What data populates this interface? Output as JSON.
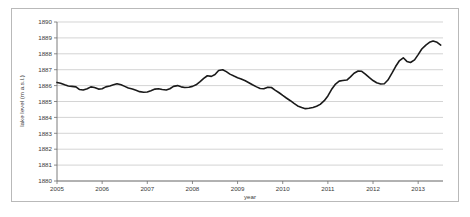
{
  "chart_data": {
    "type": "line",
    "title": "",
    "xlabel": "year",
    "ylabel": "lake level (m a.s.l.)",
    "xlim": [
      2005,
      2013.55
    ],
    "ylim": [
      1880,
      1890
    ],
    "grid": true,
    "legend": false,
    "xticks": [
      "2005",
      "2006",
      "2007",
      "2008",
      "2009",
      "2010",
      "2011",
      "2012",
      "2013"
    ],
    "xtick_values": [
      2005,
      2006,
      2007,
      2008,
      2009,
      2010,
      2011,
      2012,
      2013
    ],
    "yticks": [
      "1880",
      "1881",
      "1882",
      "1883",
      "1884",
      "1885",
      "1886",
      "1887",
      "1888",
      "1889",
      "1890"
    ],
    "ytick_values": [
      1880,
      1881,
      1882,
      1883,
      1884,
      1885,
      1886,
      1887,
      1888,
      1889,
      1890
    ],
    "series": [
      {
        "name": "lake level",
        "color": "#1a1a1a",
        "x": [
          2005.0,
          2005.08,
          2005.17,
          2005.25,
          2005.33,
          2005.42,
          2005.5,
          2005.58,
          2005.67,
          2005.75,
          2005.83,
          2005.92,
          2006.0,
          2006.08,
          2006.17,
          2006.25,
          2006.33,
          2006.42,
          2006.5,
          2006.58,
          2006.67,
          2006.75,
          2006.83,
          2006.92,
          2007.0,
          2007.08,
          2007.17,
          2007.25,
          2007.33,
          2007.42,
          2007.5,
          2007.58,
          2007.67,
          2007.75,
          2007.83,
          2007.92,
          2008.0,
          2008.08,
          2008.17,
          2008.25,
          2008.33,
          2008.42,
          2008.5,
          2008.58,
          2008.67,
          2008.75,
          2008.83,
          2008.92,
          2009.0,
          2009.08,
          2009.17,
          2009.25,
          2009.33,
          2009.42,
          2009.5,
          2009.58,
          2009.67,
          2009.75,
          2009.83,
          2009.92,
          2010.0,
          2010.08,
          2010.17,
          2010.25,
          2010.33,
          2010.42,
          2010.5,
          2010.58,
          2010.67,
          2010.75,
          2010.83,
          2010.92,
          2011.0,
          2011.08,
          2011.17,
          2011.25,
          2011.33,
          2011.42,
          2011.5,
          2011.58,
          2011.67,
          2011.75,
          2011.83,
          2011.92,
          2012.0,
          2012.08,
          2012.17,
          2012.25,
          2012.33,
          2012.42,
          2012.5,
          2012.58,
          2012.67,
          2012.75,
          2012.83,
          2012.92,
          2013.0,
          2013.08,
          2013.17,
          2013.25,
          2013.33,
          2013.42,
          2013.5
        ],
        "y": [
          1886.2,
          1886.15,
          1886.05,
          1885.98,
          1885.95,
          1885.92,
          1885.75,
          1885.72,
          1885.8,
          1885.92,
          1885.88,
          1885.78,
          1885.8,
          1885.92,
          1885.98,
          1886.05,
          1886.12,
          1886.05,
          1885.95,
          1885.85,
          1885.78,
          1885.7,
          1885.62,
          1885.58,
          1885.6,
          1885.68,
          1885.78,
          1885.8,
          1885.75,
          1885.72,
          1885.8,
          1885.95,
          1886.0,
          1885.92,
          1885.88,
          1885.9,
          1885.95,
          1886.05,
          1886.25,
          1886.45,
          1886.62,
          1886.58,
          1886.7,
          1886.95,
          1887.0,
          1886.88,
          1886.72,
          1886.6,
          1886.5,
          1886.42,
          1886.3,
          1886.18,
          1886.05,
          1885.92,
          1885.82,
          1885.8,
          1885.9,
          1885.88,
          1885.72,
          1885.55,
          1885.38,
          1885.22,
          1885.05,
          1884.88,
          1884.72,
          1884.62,
          1884.55,
          1884.58,
          1884.62,
          1884.7,
          1884.82,
          1885.05,
          1885.35,
          1885.75,
          1886.1,
          1886.28,
          1886.32,
          1886.35,
          1886.55,
          1886.78,
          1886.92,
          1886.9,
          1886.72,
          1886.5,
          1886.32,
          1886.18,
          1886.1,
          1886.12,
          1886.35,
          1886.78,
          1887.2,
          1887.55,
          1887.75,
          1887.52,
          1887.45,
          1887.62,
          1887.95,
          1888.3,
          1888.55,
          1888.72,
          1888.8,
          1888.72,
          1888.55
        ]
      }
    ]
  },
  "axes": {
    "y_title": "lake level (m a.s.l.)",
    "x_title": "year"
  }
}
